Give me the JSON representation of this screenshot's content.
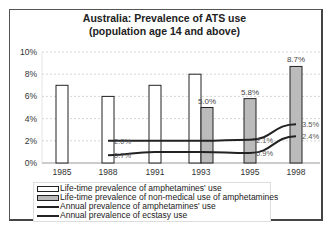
{
  "chart_data": {
    "type": "bar",
    "title": "Australia: Prevalence of ATS use",
    "subtitle": "(population age 14 and above)",
    "xlabel": "",
    "ylabel": "",
    "ylim": [
      0,
      10
    ],
    "yticks": [
      "0%",
      "2%",
      "4%",
      "6%",
      "8%",
      "10%"
    ],
    "grid": true,
    "legend_position": "bottom",
    "categories": [
      "1985",
      "1988",
      "1991",
      "1993",
      "1995",
      "1998"
    ],
    "series": [
      {
        "name": "Life-time prevalence of amphetamines' use",
        "kind": "bar",
        "fill": "#ffffff",
        "values": [
          7.0,
          6.0,
          7.0,
          8.0,
          null,
          null
        ]
      },
      {
        "name": "Life-time prevalence of non-medical use of amphetamines",
        "kind": "bar",
        "fill": "#bbbbbb",
        "values": [
          null,
          null,
          null,
          5.0,
          5.8,
          8.7
        ],
        "labels": [
          "",
          "",
          "",
          "5.0%",
          "5.8%",
          "8.7%"
        ]
      },
      {
        "name": "Annual prevalence of amphetamines' use",
        "kind": "line",
        "color": "#222222",
        "values": [
          null,
          2.0,
          2.0,
          2.0,
          2.1,
          3.5
        ],
        "labels": [
          "",
          "2.0%",
          "",
          "",
          "2.1%",
          "3.5%"
        ]
      },
      {
        "name": "Annual prevalence of ecstasy use",
        "kind": "line",
        "color": "#222222",
        "values": [
          null,
          0.7,
          1.0,
          1.0,
          0.9,
          2.4
        ],
        "labels": [
          "",
          "0.7%",
          "",
          "",
          "0.9%",
          "2.4%"
        ]
      }
    ]
  },
  "legend": {
    "items": [
      "Life-time prevalence of amphetamines' use",
      "Life-time prevalence of non-medical use of amphetamines",
      "Annual prevalence of amphetamines' use",
      "Annual prevalence of ecstasy use"
    ]
  }
}
